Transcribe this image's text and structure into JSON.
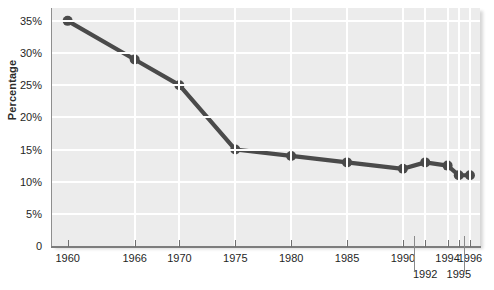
{
  "chart_data": {
    "type": "line",
    "title": "",
    "xlabel": "",
    "ylabel": "Percentage",
    "categories": [
      "1960",
      "1966",
      "1970",
      "1975",
      "1980",
      "1985",
      "1990",
      "1992",
      "1994",
      "1995",
      "1996"
    ],
    "x": [
      1960,
      1966,
      1970,
      1975,
      1980,
      1985,
      1990,
      1992,
      1994,
      1995,
      1996
    ],
    "values": [
      35,
      29,
      25,
      15,
      14,
      13,
      12,
      13,
      12.5,
      11,
      11
    ],
    "series": [
      {
        "name": "Percentage",
        "values": [
          35,
          29,
          25,
          15,
          14,
          13,
          12,
          13,
          12.5,
          11,
          11
        ]
      }
    ],
    "ylim": [
      0,
      37
    ],
    "xlim": [
      1958.6,
      1996.9
    ],
    "grid": true,
    "legend": false,
    "legend_position": "none",
    "line_color": "#4a4a4a",
    "marker_color": "#4a4a4a",
    "plot_background": "#ececec",
    "gridline_color": "#ffffff",
    "y_ticks": [
      {
        "value": 0,
        "label": "0"
      },
      {
        "value": 5,
        "label": "5%"
      },
      {
        "value": 10,
        "label": "10%"
      },
      {
        "value": 15,
        "label": "15%"
      },
      {
        "value": 20,
        "label": "20%"
      },
      {
        "value": 25,
        "label": "25%"
      },
      {
        "value": 30,
        "label": "30%"
      },
      {
        "value": 35,
        "label": "35%"
      }
    ],
    "x_ticks": [
      {
        "value": 1960,
        "label": "1960",
        "row": 0
      },
      {
        "value": 1966,
        "label": "1966",
        "row": 0
      },
      {
        "value": 1970,
        "label": "1970",
        "row": 0
      },
      {
        "value": 1975,
        "label": "1975",
        "row": 0
      },
      {
        "value": 1980,
        "label": "1980",
        "row": 0
      },
      {
        "value": 1985,
        "label": "1985",
        "row": 0
      },
      {
        "value": 1990,
        "label": "1990",
        "row": 0
      },
      {
        "value": 1992,
        "label": "1992",
        "row": 1
      },
      {
        "value": 1994,
        "label": "1994",
        "row": 0
      },
      {
        "value": 1995,
        "label": "1995",
        "row": 1
      },
      {
        "value": 1996,
        "label": "1996",
        "row": 0
      }
    ]
  }
}
